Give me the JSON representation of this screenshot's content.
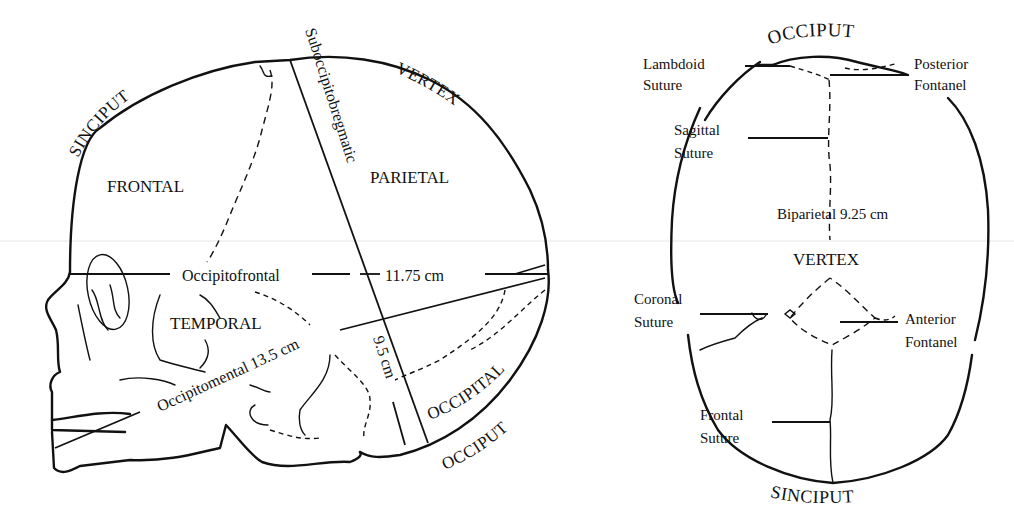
{
  "lateral_view": {
    "arc_labels": {
      "sinciput": "SINCIPUT",
      "vertex": "VERTEX",
      "occiput": "OCCIPUT"
    },
    "regions": {
      "frontal": "FRONTAL",
      "parietal": "PARIETAL",
      "temporal": "TEMPORAL",
      "occipital": "OCCIPITAL"
    },
    "measurements": {
      "suboccipitobregmatic": "Suboccipitobregmatic",
      "suboccipitobregmatic_value": "9.5 cm",
      "occipitofrontal": "Occipitofrontal",
      "occipitofrontal_value": "11.75 cm",
      "occipitomental": "Occipitomental",
      "occipitomental_value": "13.5 cm"
    }
  },
  "superior_view": {
    "arc_labels": {
      "occiput": "OCCIPUT",
      "vertex": "VERTEX",
      "sinciput": "SINCIPUT"
    },
    "labels": {
      "lambdoid_1": "Lambdoid",
      "lambdoid_2": "Suture",
      "posterior_1": "Posterior",
      "posterior_2": "Fontanel",
      "sagittal_1": "Sagittal",
      "sagittal_2": "Suture",
      "coronal_1": "Coronal",
      "coronal_2": "Suture",
      "anterior_1": "Anterior",
      "anterior_2": "Fontanel",
      "frontal_1": "Frontal",
      "frontal_2": "Suture"
    },
    "measurements": {
      "biparietal": "Biparietal 9.25 cm"
    }
  },
  "colors": {
    "ink": "#111111",
    "background": "#ffffff",
    "scan_line": "#e4e4e4"
  }
}
